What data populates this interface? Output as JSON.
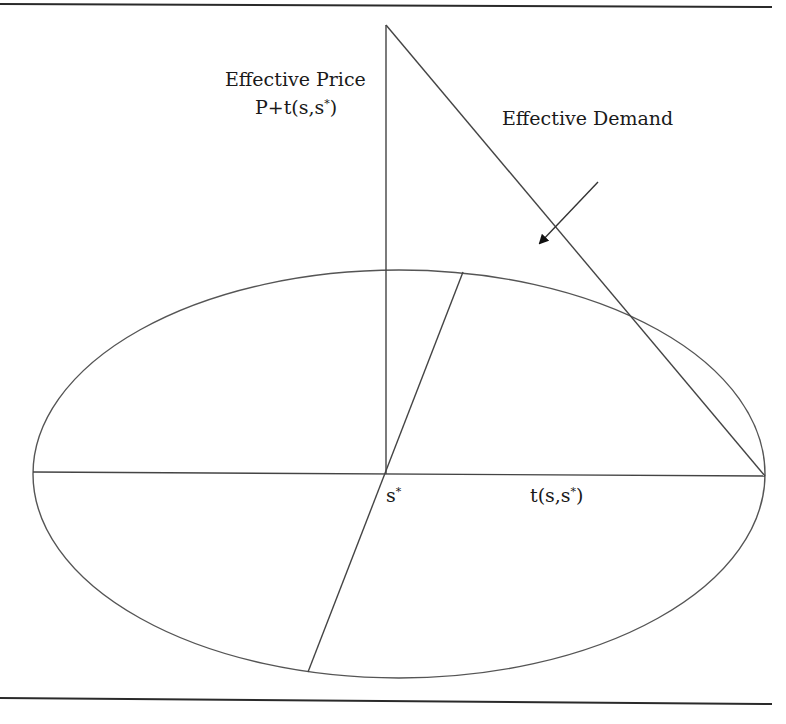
{
  "figure": {
    "labels": {
      "y_axis_line1": "Effective Price",
      "y_axis_line2_pre": "P+t(s,s",
      "y_axis_line2_sup": "*",
      "y_axis_line2_post": ")",
      "demand": "Effective Demand",
      "origin_pre": "s",
      "origin_sup": "*",
      "x_axis_pre": "t(s,s",
      "x_axis_sup": "*",
      "x_axis_post": ")"
    },
    "colors": {
      "line": "#3a3a3a",
      "rule": "#2a2a2a",
      "text": "#1a1a1a",
      "background": "#ffffff"
    }
  }
}
